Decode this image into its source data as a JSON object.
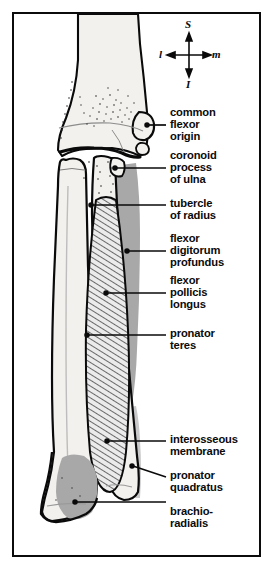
{
  "figure": {
    "view": "anterior right forearm",
    "border_color": "#0b0b0b",
    "background": "#ffffff"
  },
  "orientation_compass": {
    "name": "orientation-compass",
    "superior": "S",
    "inferior": "I",
    "lateral": "l",
    "medial": "m"
  },
  "labels": [
    {
      "id": "common-flexor-origin",
      "lines": [
        "common",
        "flexor",
        "origin"
      ]
    },
    {
      "id": "coronoid-process-of-ulna",
      "lines": [
        "coronoid",
        "process",
        "of ulna"
      ]
    },
    {
      "id": "tubercle-of-radius",
      "lines": [
        "tubercle",
        "of radius"
      ]
    },
    {
      "id": "flexor-digitorum-profundus",
      "lines": [
        "flexor",
        "digitorum",
        "profundus"
      ]
    },
    {
      "id": "flexor-pollicis-longus",
      "lines": [
        "flexor",
        "pollicis",
        "longus"
      ]
    },
    {
      "id": "pronator-teres",
      "lines": [
        "pronator",
        "teres"
      ]
    },
    {
      "id": "interosseous-membrane",
      "lines": [
        "interosseous",
        "membrane"
      ]
    },
    {
      "id": "pronator-quadratus",
      "lines": [
        "pronator",
        "quadratus"
      ]
    },
    {
      "id": "brachioradialis",
      "lines": [
        "brachio-",
        "radialis"
      ]
    }
  ],
  "structures": {
    "bone_fill": "#f2f1ee",
    "bone_outline": "#0a0a0a",
    "muscle_gray": "#a8a8a8",
    "muscle_gray_light": "#c9c9c9",
    "hatch_color": "#3a3a3a",
    "leader_color": "#0a0a0a",
    "names": [
      "humerus",
      "radius",
      "ulna",
      "interosseous-membrane",
      "pronator-teres",
      "flexor-digitorum-profundus",
      "flexor-pollicis-longus",
      "pronator-quadratus",
      "brachioradialis"
    ]
  }
}
